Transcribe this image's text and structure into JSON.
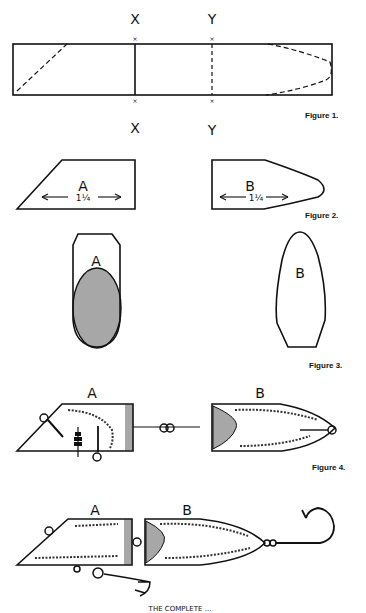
{
  "figure1": {
    "caption": "Figure 1.",
    "cut_labels_top": [
      "X",
      "Y"
    ],
    "cut_labels_bottom": [
      "X",
      "Y"
    ]
  },
  "figure2": {
    "caption": "Figure 2.",
    "part_a": {
      "label": "A",
      "dimension": "1¼"
    },
    "part_b": {
      "label": "B",
      "dimension": "1¼"
    }
  },
  "figure3": {
    "caption": "Figure 3.",
    "part_a": {
      "label": "A"
    },
    "part_b": {
      "label": "B"
    }
  },
  "figure4": {
    "caption": "Figure 4.",
    "part_a": {
      "label": "A"
    },
    "part_b": {
      "label": "B"
    }
  },
  "figure5": {
    "part_a": {
      "label": "A"
    },
    "part_b": {
      "label": "B"
    },
    "caption": "THE COMPLETE ..."
  }
}
